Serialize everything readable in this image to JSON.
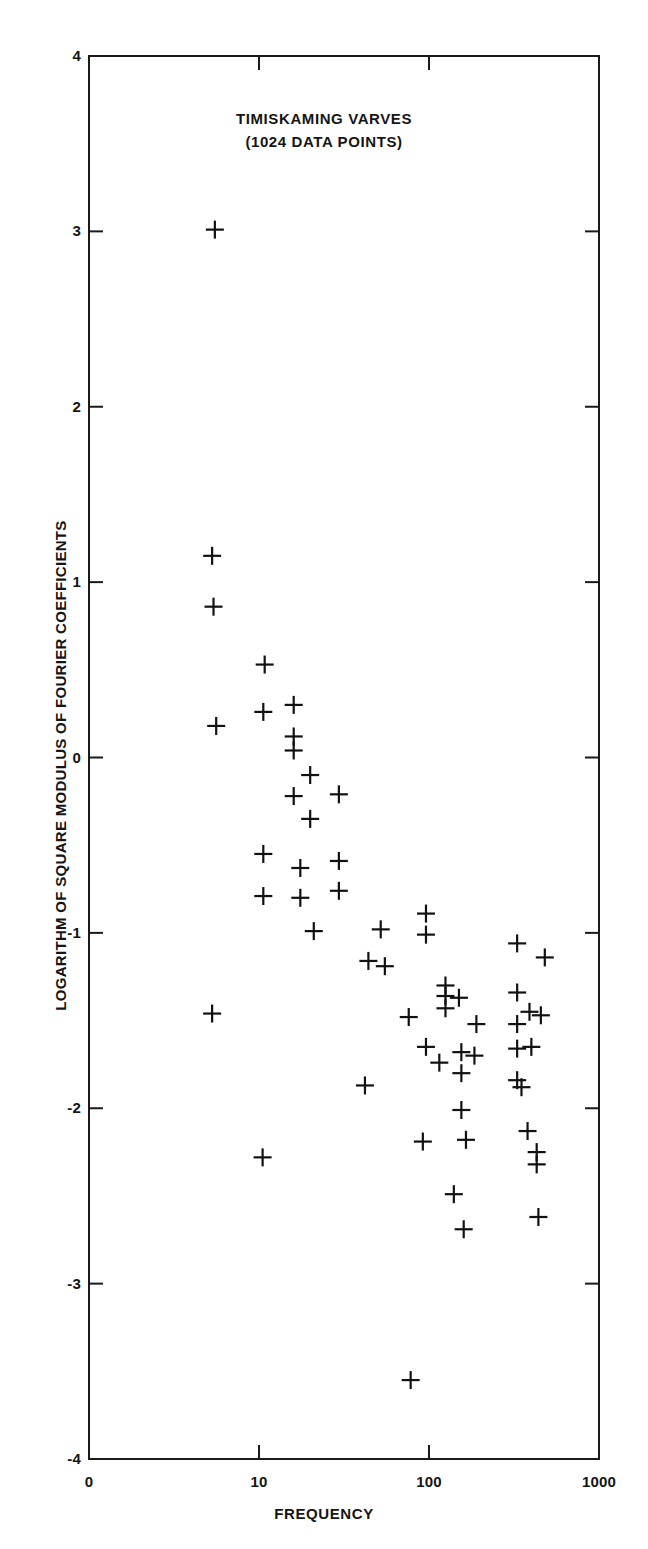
{
  "chart_data": {
    "type": "scatter",
    "title": "TIMISKAMING VARVES",
    "subtitle": "(1024 DATA POINTS)",
    "xlabel": "FREQUENCY",
    "ylabel": "LOGARITHM OF SQUARE MODULUS OF FOURIER COEFFICIENTS",
    "xscale": "log",
    "yscale": "linear",
    "xlim": [
      1,
      1000
    ],
    "ylim": [
      -4,
      4
    ],
    "grid": false,
    "legend": null,
    "marker": "plus",
    "xticks": [
      {
        "value": 1,
        "label": "0"
      },
      {
        "value": 10,
        "label": "10"
      },
      {
        "value": 100,
        "label": "100"
      },
      {
        "value": 1000,
        "label": "1000"
      }
    ],
    "yticks": [
      {
        "value": 4,
        "label": "4"
      },
      {
        "value": 3,
        "label": "3"
      },
      {
        "value": 2,
        "label": "2"
      },
      {
        "value": 1,
        "label": "1"
      },
      {
        "value": 0,
        "label": "0"
      },
      {
        "value": -1,
        "label": "-1"
      },
      {
        "value": -2,
        "label": "-2"
      },
      {
        "value": -3,
        "label": "-3"
      },
      {
        "value": -4,
        "label": "-4"
      }
    ],
    "points": [
      {
        "x": 5.5,
        "y": 3.01
      },
      {
        "x": 5.3,
        "y": 1.15
      },
      {
        "x": 5.4,
        "y": 0.86
      },
      {
        "x": 10.8,
        "y": 0.53
      },
      {
        "x": 5.6,
        "y": 0.18
      },
      {
        "x": 10.6,
        "y": 0.26
      },
      {
        "x": 16.0,
        "y": 0.3
      },
      {
        "x": 16.0,
        "y": 0.12
      },
      {
        "x": 16.0,
        "y": 0.04
      },
      {
        "x": 20.0,
        "y": -0.1
      },
      {
        "x": 16.0,
        "y": -0.22
      },
      {
        "x": 29.5,
        "y": -0.21
      },
      {
        "x": 20.0,
        "y": -0.35
      },
      {
        "x": 10.6,
        "y": -0.55
      },
      {
        "x": 17.5,
        "y": -0.63
      },
      {
        "x": 29.5,
        "y": -0.59
      },
      {
        "x": 10.6,
        "y": -0.79
      },
      {
        "x": 17.5,
        "y": -0.8
      },
      {
        "x": 29.5,
        "y": -0.76
      },
      {
        "x": 21.0,
        "y": -0.99
      },
      {
        "x": 52.0,
        "y": -0.98
      },
      {
        "x": 96.0,
        "y": -0.89
      },
      {
        "x": 96.0,
        "y": -1.01
      },
      {
        "x": 44.0,
        "y": -1.16
      },
      {
        "x": 55.0,
        "y": -1.19
      },
      {
        "x": 5.3,
        "y": -1.46
      },
      {
        "x": 125.0,
        "y": -1.3
      },
      {
        "x": 125.0,
        "y": -1.36
      },
      {
        "x": 125.0,
        "y": -1.43
      },
      {
        "x": 76.0,
        "y": -1.48
      },
      {
        "x": 150.0,
        "y": -1.37
      },
      {
        "x": 330.0,
        "y": -1.06
      },
      {
        "x": 480.0,
        "y": -1.14
      },
      {
        "x": 330.0,
        "y": -1.34
      },
      {
        "x": 390.0,
        "y": -1.45
      },
      {
        "x": 330.0,
        "y": -1.52
      },
      {
        "x": 455.0,
        "y": -1.47
      },
      {
        "x": 190.0,
        "y": -1.52
      },
      {
        "x": 96.0,
        "y": -1.65
      },
      {
        "x": 155.0,
        "y": -1.68
      },
      {
        "x": 185.0,
        "y": -1.7
      },
      {
        "x": 115.0,
        "y": -1.74
      },
      {
        "x": 330.0,
        "y": -1.66
      },
      {
        "x": 400.0,
        "y": -1.65
      },
      {
        "x": 155.0,
        "y": -1.8
      },
      {
        "x": 42.0,
        "y": -1.87
      },
      {
        "x": 330.0,
        "y": -1.84
      },
      {
        "x": 350.0,
        "y": -1.88
      },
      {
        "x": 155.0,
        "y": -2.01
      },
      {
        "x": 92.0,
        "y": -2.19
      },
      {
        "x": 165.0,
        "y": -2.18
      },
      {
        "x": 380.0,
        "y": -2.13
      },
      {
        "x": 10.5,
        "y": -2.28
      },
      {
        "x": 430.0,
        "y": -2.25
      },
      {
        "x": 430.0,
        "y": -2.32
      },
      {
        "x": 140.0,
        "y": -2.49
      },
      {
        "x": 160.0,
        "y": -2.69
      },
      {
        "x": 440.0,
        "y": -2.62
      },
      {
        "x": 78.0,
        "y": -3.55
      }
    ]
  },
  "page": {
    "top_left_mark": "",
    "top_right_mark": ""
  }
}
